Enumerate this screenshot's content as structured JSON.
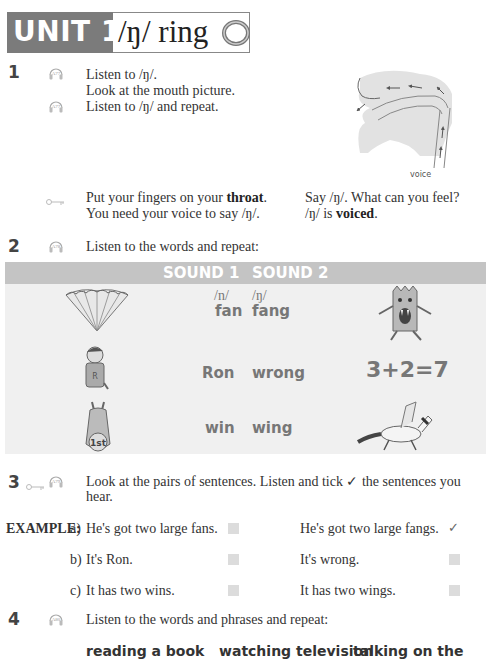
{
  "header": {
    "unit": "UNIT 14",
    "title": "/ŋ/ ring",
    "icon": "ring-icon"
  },
  "ex1": {
    "number": "1",
    "audio_track": "A77",
    "lines": [
      "Listen to /ŋ/.",
      "Look at the mouth picture.",
      "Listen to /ŋ/ and repeat."
    ],
    "audio_track_2": "A77",
    "diagram_label": "voice",
    "tip_left_1_pre": "Put your fingers on your ",
    "tip_left_1_bold": "throat",
    "tip_left_1_post": ".",
    "tip_left_2": "You need your voice to say /ŋ/.",
    "tip_right_1": "Say /ŋ/. What can you feel?",
    "tip_right_2_pre": "/ŋ/ is ",
    "tip_right_2_bold": "voiced",
    "tip_right_2_post": "."
  },
  "ex2": {
    "number": "2",
    "audio_track": "A78",
    "instruction": "Listen to the words and repeat:",
    "table": {
      "headers": [
        "SOUND 1",
        "SOUND 2"
      ],
      "phonemes": [
        "/n/",
        "/ŋ/"
      ],
      "rows": [
        {
          "sound1": "fan",
          "sound2": "fang",
          "left_image": "fan-illustration",
          "right_image": "monster-fang-illustration"
        },
        {
          "sound1": "Ron",
          "sound2": "wrong",
          "left_image": "boy-ron-illustration",
          "right_image": "wrong-sum-illustration",
          "right_text": "3+2=7"
        },
        {
          "sound1": "win",
          "sound2": "wing",
          "left_image": "horse-winner-illustration",
          "right_image": "winged-horse-illustration"
        }
      ]
    }
  },
  "ex3": {
    "number": "3",
    "audio_track": "A79",
    "instruction": "Look at the pairs of sentences. Listen and tick ✓ the sentences you hear.",
    "example_label": "EXAMPLE:",
    "rows": [
      {
        "letter": "a)",
        "left": "He's got two large fans.",
        "left_checked": false,
        "right": "He's got two large fangs.",
        "right_checked": true
      },
      {
        "letter": "b)",
        "left": "It's Ron.",
        "left_checked": false,
        "right": "It's wrong.",
        "right_checked": false
      },
      {
        "letter": "c)",
        "left": "It has two wins.",
        "left_checked": false,
        "right": "It has two wings.",
        "right_checked": false
      }
    ],
    "tick_symbol": "✓"
  },
  "ex4": {
    "number": "4",
    "audio_track": "A80",
    "instruction": "Listen to the words and phrases and repeat:",
    "phrases": [
      "reading a book",
      "watching television",
      "talking on the phone"
    ]
  }
}
